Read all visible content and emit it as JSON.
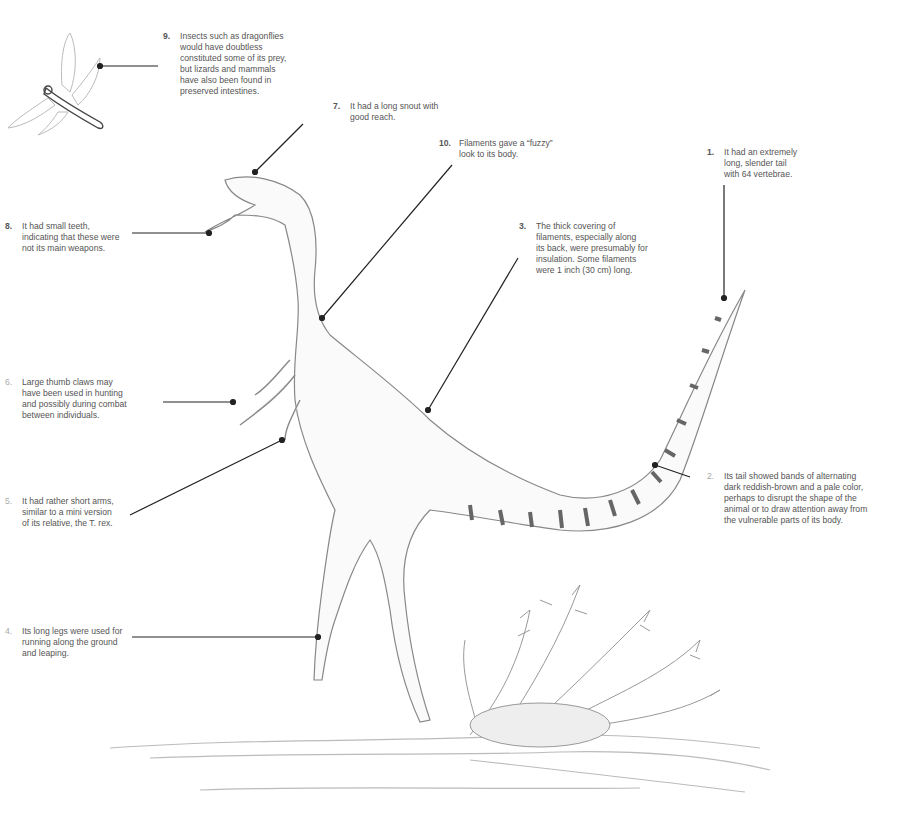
{
  "annotations": [
    {
      "id": "note-9",
      "number": "9.",
      "lines": [
        "Insects such as dragonflies",
        "would have doubtless",
        "constituted some of its prey,",
        "but lizards and mammals",
        "have also been found in",
        "preserved intestines."
      ],
      "x": 180,
      "y": 31
    },
    {
      "id": "note-7",
      "number": "7.",
      "lines": [
        "It had a long snout with",
        "good reach."
      ],
      "x": 350,
      "y": 101
    },
    {
      "id": "note-10",
      "number": "10.",
      "lines": [
        "Filaments gave a “fuzzy”",
        "look to its body."
      ],
      "x": 459,
      "y": 138
    },
    {
      "id": "note-1",
      "number": "1.",
      "lines": [
        "It had an extremely",
        "long, slender tail",
        "with 64 vertebrae."
      ],
      "x": 724,
      "y": 147
    },
    {
      "id": "note-8",
      "number": "8.",
      "lines": [
        "It had small teeth,",
        "indicating that these were",
        "not its main weapons."
      ],
      "x": 22,
      "y": 221
    },
    {
      "id": "note-3",
      "number": "3.",
      "lines": [
        "The thick covering of",
        "filaments, especially along",
        "its back, were presumably for",
        "insulation. Some filaments",
        "were 1 inch (30 cm) long."
      ],
      "x": 536,
      "y": 221
    },
    {
      "id": "note-6",
      "number": "6.",
      "lines": [
        "Large thumb claws may",
        "have been used in hunting",
        "and possibly during combat",
        "between individuals."
      ],
      "x": 22,
      "y": 377
    },
    {
      "id": "note-2",
      "number": "2.",
      "lines": [
        "Its tail showed bands of alternating",
        "dark reddish-brown and a pale color,",
        "perhaps to disrupt the shape of the",
        "animal or to draw attention away from",
        "the vulnerable parts of its body."
      ],
      "x": 724,
      "y": 471
    },
    {
      "id": "note-5",
      "number": "5.",
      "lines": [
        "It had rather short arms,",
        "similar to a mini version",
        "of its relative, the T. rex."
      ],
      "x": 22,
      "y": 496
    },
    {
      "id": "note-4",
      "number": "4.",
      "lines": [
        "Its long legs were used for",
        "running along the ground",
        "and leaping."
      ],
      "x": 22,
      "y": 626
    }
  ],
  "colors": {
    "text": "#555555",
    "leader": "#222222",
    "sketch": "#8a8a8a",
    "band": "#6e6e6e"
  }
}
